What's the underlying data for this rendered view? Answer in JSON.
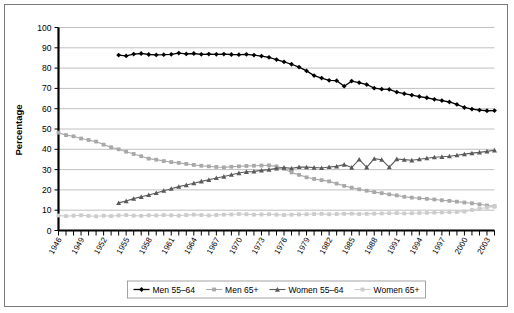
{
  "chart_data": {
    "type": "line",
    "title": "",
    "xlabel": "",
    "ylabel": "Percentage",
    "ylim": [
      0,
      100
    ],
    "ytick_step": 10,
    "yticks": [
      0,
      10,
      20,
      30,
      40,
      50,
      60,
      70,
      80,
      90,
      100
    ],
    "grid": true,
    "legend_position": "bottom",
    "x_start": 1946,
    "x_end": 2004,
    "xticks_labeled": [
      1946,
      1949,
      1952,
      1955,
      1958,
      1961,
      1964,
      1967,
      1970,
      1973,
      1976,
      1979,
      1982,
      1985,
      1988,
      1991,
      1994,
      1997,
      2000,
      2003
    ],
    "x_all": [
      1946,
      1947,
      1948,
      1949,
      1950,
      1951,
      1952,
      1953,
      1954,
      1955,
      1956,
      1957,
      1958,
      1959,
      1960,
      1961,
      1962,
      1963,
      1964,
      1965,
      1966,
      1967,
      1968,
      1969,
      1970,
      1971,
      1972,
      1973,
      1974,
      1975,
      1976,
      1977,
      1978,
      1979,
      1980,
      1981,
      1982,
      1983,
      1984,
      1985,
      1986,
      1987,
      1988,
      1989,
      1990,
      1991,
      1992,
      1993,
      1994,
      1995,
      1996,
      1997,
      1998,
      1999,
      2000,
      2001,
      2002,
      2003,
      2004
    ],
    "series": [
      {
        "name": "Men 55-64",
        "color": "#000000",
        "marker": "diamond",
        "x_start": 1954,
        "values": [
          86.4,
          86.0,
          86.9,
          87.2,
          86.7,
          86.5,
          86.6,
          86.8,
          87.4,
          87.0,
          87.2,
          86.8,
          86.9,
          86.8,
          86.9,
          86.7,
          86.6,
          86.8,
          86.4,
          85.9,
          85.3,
          84.2,
          83.1,
          81.9,
          80.5,
          78.6,
          76.3,
          75.1,
          74.0,
          73.8,
          71.1,
          73.6,
          72.8,
          71.9,
          70.1,
          69.6,
          69.5,
          68.2,
          67.4,
          66.7,
          66.0,
          65.4,
          64.6,
          64.0,
          63.3,
          62.1,
          60.6,
          59.8,
          59.3,
          59.0,
          59.1,
          58.6,
          59.2,
          59.9,
          60.6,
          62.4,
          64.5,
          65.9,
          66.4
        ]
      },
      {
        "name": "Men 65+",
        "color": "#a8a8a8",
        "marker": "square",
        "x_start": 1946,
        "values": [
          48.2,
          47.0,
          46.4,
          45.3,
          44.6,
          43.8,
          42.3,
          41.0,
          40.0,
          38.8,
          37.7,
          36.6,
          35.4,
          34.9,
          34.2,
          33.7,
          33.3,
          32.8,
          32.3,
          31.9,
          31.6,
          31.3,
          31.1,
          31.4,
          31.6,
          31.8,
          31.9,
          32.0,
          32.1,
          31.6,
          30.4,
          28.6,
          27.4,
          26.2,
          25.4,
          24.8,
          24.2,
          23.1,
          22.0,
          21.1,
          20.3,
          19.6,
          18.9,
          18.4,
          17.8,
          17.3,
          16.6,
          16.2,
          15.9,
          15.6,
          15.3,
          14.9,
          14.6,
          14.2,
          13.8,
          13.4,
          12.9,
          12.3,
          11.9
        ]
      },
      {
        "name": "Women 55-64",
        "color": "#5a5a5a",
        "marker": "triangle",
        "x_start": 1954,
        "values": [
          13.6,
          14.5,
          15.7,
          16.6,
          17.5,
          18.5,
          19.6,
          20.6,
          21.6,
          22.4,
          23.3,
          24.2,
          25.0,
          25.9,
          26.6,
          27.5,
          28.3,
          28.9,
          29.1,
          29.6,
          30.0,
          30.6,
          31.0,
          30.6,
          31.3,
          31.2,
          31.0,
          30.8,
          31.3,
          31.6,
          32.5,
          31.0,
          35.0,
          31.1,
          35.4,
          34.9,
          31.2,
          35.2,
          34.9,
          34.6,
          35.1,
          35.6,
          36.1,
          36.3,
          36.6,
          37.1,
          37.6,
          38.1,
          38.5,
          39.0,
          39.5,
          41.4,
          42.9,
          44.8,
          46.4,
          47.8,
          48.1
        ]
      },
      {
        "name": "Women 65+",
        "color": "#cccccc",
        "marker": "square",
        "x_start": 1946,
        "values": [
          7.4,
          7.1,
          7.3,
          7.5,
          7.2,
          7.0,
          7.3,
          7.1,
          7.4,
          7.6,
          7.3,
          7.2,
          7.5,
          7.4,
          7.6,
          7.5,
          7.3,
          7.6,
          7.8,
          7.6,
          7.4,
          7.6,
          7.8,
          7.9,
          8.1,
          8.0,
          7.8,
          7.9,
          8.0,
          7.8,
          7.6,
          7.8,
          7.9,
          8.0,
          8.1,
          8.2,
          8.0,
          8.1,
          8.2,
          8.3,
          8.1,
          8.2,
          8.3,
          8.4,
          8.5,
          8.6,
          8.4,
          8.5,
          8.6,
          8.7,
          8.8,
          8.9,
          9.0,
          9.1,
          9.3,
          10.1,
          10.8,
          11.3,
          11.8
        ]
      }
    ]
  },
  "axis": {
    "y_title": "Percentage"
  },
  "legend": {
    "items": [
      {
        "label": "Men 55–64"
      },
      {
        "label": "Men 65+"
      },
      {
        "label": "Women 55–64"
      },
      {
        "label": "Women 65+"
      }
    ]
  }
}
